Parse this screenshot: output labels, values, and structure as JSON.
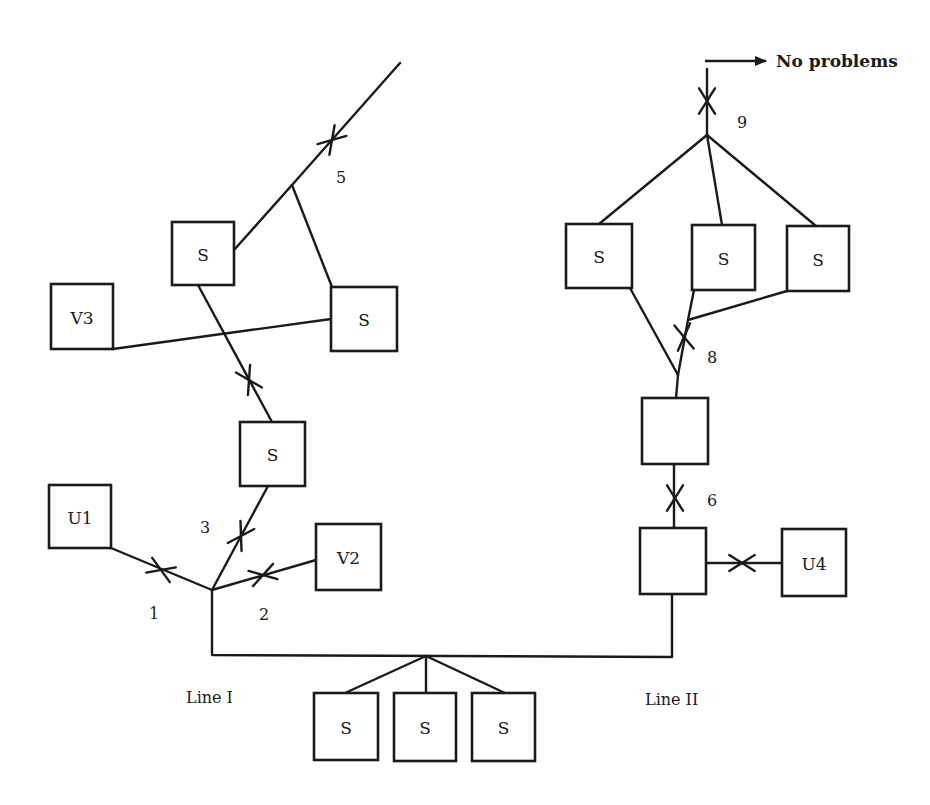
{
  "diagram": {
    "title": "",
    "annotation": {
      "text": "No problems",
      "x": 776,
      "y": 67,
      "arrow": {
        "x1": 705,
        "y1": 61,
        "x2": 766,
        "y2": 61
      }
    },
    "line_labels": [
      {
        "id": "line-1",
        "text": "Line I",
        "x": 186,
        "y": 703
      },
      {
        "id": "line-2",
        "text": "Line II",
        "x": 645,
        "y": 705
      }
    ],
    "nodes": [
      {
        "id": "s-top-left",
        "label": "S",
        "x": 172,
        "y": 222,
        "w": 62,
        "h": 63
      },
      {
        "id": "s-top-mid",
        "label": "S",
        "x": 331,
        "y": 287,
        "w": 66,
        "h": 64
      },
      {
        "id": "v3",
        "label": "V3",
        "x": 51,
        "y": 284,
        "w": 62,
        "h": 65
      },
      {
        "id": "s-mid-left",
        "label": "S",
        "x": 240,
        "y": 422,
        "w": 65,
        "h": 64
      },
      {
        "id": "u1",
        "label": "U1",
        "x": 49,
        "y": 485,
        "w": 62,
        "h": 63
      },
      {
        "id": "v2",
        "label": "V2",
        "x": 316,
        "y": 524,
        "w": 65,
        "h": 66
      },
      {
        "id": "s-right-a",
        "label": "S",
        "x": 566,
        "y": 224,
        "w": 66,
        "h": 64
      },
      {
        "id": "s-right-b",
        "label": "S",
        "x": 692,
        "y": 225,
        "w": 63,
        "h": 65
      },
      {
        "id": "s-right-c",
        "label": "S",
        "x": 787,
        "y": 226,
        "w": 62,
        "h": 65
      },
      {
        "id": "box-right-upper",
        "label": "",
        "x": 642,
        "y": 398,
        "w": 66,
        "h": 66
      },
      {
        "id": "box-right-lower",
        "label": "",
        "x": 640,
        "y": 528,
        "w": 66,
        "h": 66
      },
      {
        "id": "u4",
        "label": "U4",
        "x": 782,
        "y": 529,
        "w": 64,
        "h": 67
      },
      {
        "id": "s-bottom-1",
        "label": "S",
        "x": 314,
        "y": 693,
        "w": 64,
        "h": 67
      },
      {
        "id": "s-bottom-2",
        "label": "S",
        "x": 394,
        "y": 693,
        "w": 62,
        "h": 68
      },
      {
        "id": "s-bottom-3",
        "label": "S",
        "x": 472,
        "y": 693,
        "w": 63,
        "h": 68
      }
    ],
    "edges": [
      {
        "id": "feed-top-left",
        "points": [
          [
            400,
            63
          ],
          [
            292,
            185
          ],
          [
            234,
            250
          ]
        ]
      },
      {
        "id": "junction-to-s-top-mid",
        "points": [
          [
            292,
            185
          ],
          [
            332,
            287
          ]
        ]
      },
      {
        "id": "v3-to-s-top-mid",
        "points": [
          [
            113,
            349
          ],
          [
            331,
            319
          ]
        ]
      },
      {
        "id": "s-top-left-to-s-mid-left",
        "points": [
          [
            198,
            285
          ],
          [
            272,
            422
          ]
        ]
      },
      {
        "id": "s-mid-left-to-hub",
        "points": [
          [
            268,
            486
          ],
          [
            212,
            590
          ]
        ]
      },
      {
        "id": "u1-to-hub",
        "points": [
          [
            111,
            548
          ],
          [
            212,
            590
          ]
        ]
      },
      {
        "id": "v2-to-hub",
        "points": [
          [
            316,
            560
          ],
          [
            212,
            590
          ]
        ]
      },
      {
        "id": "line-1-trunk",
        "points": [
          [
            212,
            590
          ],
          [
            212,
            655
          ],
          [
            672,
            657
          ],
          [
            672,
            594
          ]
        ]
      },
      {
        "id": "trunk-to-s-bottom-1",
        "points": [
          [
            426,
            656
          ],
          [
            345,
            693
          ]
        ]
      },
      {
        "id": "trunk-to-s-bottom-2",
        "points": [
          [
            426,
            656
          ],
          [
            426,
            693
          ]
        ]
      },
      {
        "id": "trunk-to-s-bottom-3",
        "points": [
          [
            426,
            656
          ],
          [
            505,
            693
          ]
        ]
      },
      {
        "id": "lower-to-upper-box",
        "points": [
          [
            674,
            528
          ],
          [
            674,
            464
          ]
        ]
      },
      {
        "id": "lower-box-to-u4",
        "points": [
          [
            706,
            563
          ],
          [
            782,
            563
          ]
        ]
      },
      {
        "id": "upper-box-to-merge",
        "points": [
          [
            676,
            398
          ],
          [
            678,
            375
          ]
        ]
      },
      {
        "id": "s-right-a-to-merge",
        "points": [
          [
            630,
            288
          ],
          [
            678,
            375
          ]
        ]
      },
      {
        "id": "s-right-b-to-merge",
        "points": [
          [
            694,
            290
          ],
          [
            688,
            320
          ],
          [
            678,
            375
          ]
        ]
      },
      {
        "id": "s-right-c-to-merge",
        "points": [
          [
            787,
            291
          ],
          [
            688,
            320
          ]
        ]
      },
      {
        "id": "top-junction-to-s-right-a",
        "points": [
          [
            707,
            135
          ],
          [
            599,
            224
          ]
        ]
      },
      {
        "id": "top-junction-to-s-right-b",
        "points": [
          [
            707,
            135
          ],
          [
            722,
            225
          ]
        ]
      },
      {
        "id": "top-junction-to-s-right-c",
        "points": [
          [
            707,
            135
          ],
          [
            816,
            226
          ]
        ]
      },
      {
        "id": "line-2-feed",
        "points": [
          [
            707,
            135
          ],
          [
            707,
            69
          ]
        ]
      }
    ],
    "breakers": [
      {
        "id": "breaker-1",
        "number": "1",
        "cx": 161,
        "cy": 570,
        "angle": 22,
        "label_x": 154,
        "label_y": 613
      },
      {
        "id": "breaker-2",
        "number": "2",
        "cx": 263,
        "cy": 575,
        "angle": -16,
        "label_x": 264,
        "label_y": 614
      },
      {
        "id": "breaker-3",
        "number": "3",
        "cx": 241,
        "cy": 536,
        "angle": -60,
        "label_x": 205,
        "label_y": 527
      },
      {
        "id": "breaker-4",
        "number": "",
        "cx": 249,
        "cy": 380,
        "angle": 62,
        "label_x": 0,
        "label_y": 0
      },
      {
        "id": "breaker-5",
        "number": "5",
        "cx": 332,
        "cy": 140,
        "angle": -48,
        "label_x": 341,
        "label_y": 177
      },
      {
        "id": "breaker-6",
        "number": "6",
        "cx": 675,
        "cy": 498,
        "angle": 90,
        "label_x": 712,
        "label_y": 500
      },
      {
        "id": "breaker-7",
        "number": "",
        "cx": 742,
        "cy": 563,
        "angle": 0,
        "label_x": 0,
        "label_y": 0
      },
      {
        "id": "breaker-8",
        "number": "8",
        "cx": 684,
        "cy": 337,
        "angle": 82,
        "label_x": 712,
        "label_y": 357
      },
      {
        "id": "breaker-9",
        "number": "9",
        "cx": 707,
        "cy": 101,
        "angle": 90,
        "label_x": 742,
        "label_y": 122
      }
    ]
  }
}
